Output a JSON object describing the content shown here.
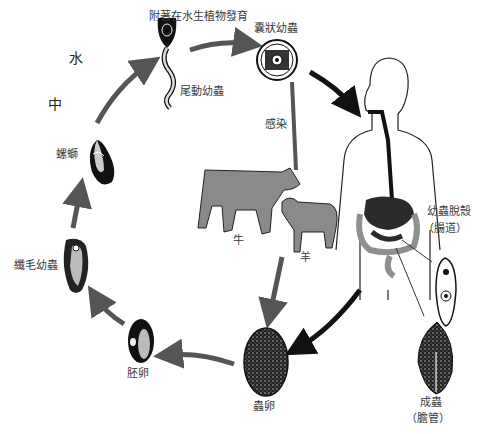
{
  "diagram": {
    "title_faint": "",
    "environment_label_1": "水",
    "environment_label_2": "中",
    "stages": {
      "cercaria_attach": "附著在水生植物發育",
      "cercaria": "尾動幼蟲",
      "metacercaria": "囊狀幼蟲",
      "infection": "感染",
      "cow": "牛",
      "sheep": "羊",
      "snail": "螺螄",
      "miracidium": "纖毛幼蟲",
      "embryonated_egg": "胚卵",
      "egg": "蟲卵",
      "excyst_line1": "幼蟲脫殼",
      "excyst_line2": "（腸道）",
      "adult_line1": "成蟲",
      "adult_line2": "（膽管）"
    },
    "colors": {
      "arrow_gray": "#555555",
      "arrow_black": "#111111",
      "animal_fill": "#8a8a8a",
      "organ_dark": "#2a2a2a",
      "organ_gray": "#8f8f8f"
    }
  }
}
